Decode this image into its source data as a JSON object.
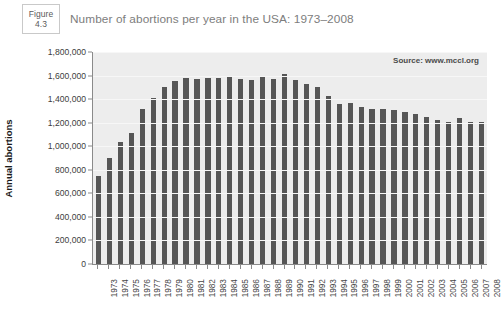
{
  "figure_badge": {
    "word": "Figure",
    "number": "4.3"
  },
  "title": "Number of abortions per year in the USA: 1973–2008",
  "source_note": "Source: www.mccl.org",
  "colors": {
    "bar": "#565656",
    "plot_background": "#ededed",
    "axis": "#8a8a8a",
    "title_text": "#7d7d7d",
    "gridline": "#f7f7f7"
  },
  "chart_data": {
    "type": "bar",
    "title": "Number of abortions per year in the USA: 1973–2008",
    "xlabel": "",
    "ylabel": "Annual abortions",
    "ylim": [
      0,
      1800000
    ],
    "ytick_step": 200000,
    "grid": true,
    "legend": null,
    "annotations": [
      "Source: www.mccl.org"
    ],
    "ytick_labels": [
      "0",
      "200,000",
      "400,000",
      "600,000",
      "800,000",
      "1,000,000",
      "1,200,000",
      "1,400,000",
      "1,600,000",
      "1,800,000"
    ],
    "ytick_values": [
      0,
      200000,
      400000,
      600000,
      800000,
      1000000,
      1200000,
      1400000,
      1600000,
      1800000
    ],
    "categories": [
      "1973",
      "1974",
      "1975",
      "1976",
      "1977",
      "1978",
      "1979",
      "1980",
      "1981",
      "1982",
      "1983",
      "1984",
      "1985",
      "1986",
      "1987",
      "1988",
      "1989",
      "1990",
      "1991",
      "1992",
      "1993",
      "1994",
      "1995",
      "1996",
      "1997",
      "1998",
      "1999",
      "2000",
      "2001",
      "2002",
      "2003",
      "2004",
      "2005",
      "2006",
      "2007",
      "2008"
    ],
    "values": [
      745000,
      900000,
      1035000,
      1115000,
      1320000,
      1410000,
      1500000,
      1555000,
      1580000,
      1575000,
      1580000,
      1580000,
      1590000,
      1575000,
      1560000,
      1600000,
      1570000,
      1610000,
      1560000,
      1530000,
      1500000,
      1430000,
      1360000,
      1365000,
      1335000,
      1320000,
      1315000,
      1310000,
      1290000,
      1270000,
      1250000,
      1220000,
      1210000,
      1240000,
      1210000,
      1210000
    ]
  }
}
